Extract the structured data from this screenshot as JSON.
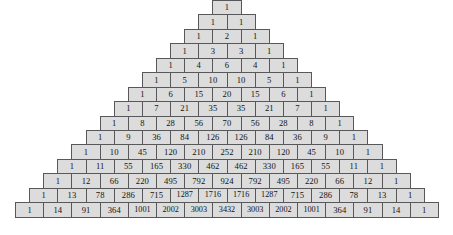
{
  "figure": {
    "name": "pascals-triangle",
    "rows_count": 15,
    "background_color": "#ffffff",
    "cell_fill_color": "#dcdcdc",
    "cell_border_color": "#58585a",
    "text_color": "#121212"
  },
  "chart_data": {
    "type": "table",
    "title": "",
    "xlabel": "",
    "ylabel": "",
    "rows": [
      [
        1
      ],
      [
        1,
        1
      ],
      [
        1,
        2,
        1
      ],
      [
        1,
        3,
        3,
        1
      ],
      [
        1,
        4,
        6,
        4,
        1
      ],
      [
        1,
        5,
        10,
        10,
        5,
        1
      ],
      [
        1,
        6,
        15,
        20,
        15,
        6,
        1
      ],
      [
        1,
        7,
        21,
        35,
        35,
        21,
        7,
        1
      ],
      [
        1,
        8,
        28,
        56,
        70,
        56,
        28,
        8,
        1
      ],
      [
        1,
        9,
        36,
        84,
        126,
        126,
        84,
        36,
        9,
        1
      ],
      [
        1,
        10,
        45,
        120,
        210,
        252,
        210,
        120,
        45,
        10,
        1
      ],
      [
        1,
        11,
        55,
        165,
        330,
        462,
        462,
        330,
        165,
        55,
        11,
        1
      ],
      [
        1,
        12,
        66,
        220,
        495,
        792,
        924,
        792,
        495,
        220,
        66,
        12,
        1
      ],
      [
        1,
        13,
        78,
        286,
        715,
        1287,
        1716,
        1716,
        1287,
        715,
        286,
        78,
        13,
        1
      ],
      [
        1,
        14,
        91,
        364,
        1001,
        2002,
        3003,
        3432,
        3003,
        2002,
        1001,
        364,
        91,
        14,
        1
      ]
    ]
  }
}
